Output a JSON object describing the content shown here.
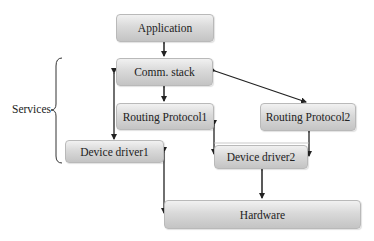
{
  "diagram": {
    "nodes": [
      {
        "id": "application",
        "label": "Application"
      },
      {
        "id": "comm_stack",
        "label": "Comm. stack"
      },
      {
        "id": "routing_protocol1",
        "label": "Routing Protocol1"
      },
      {
        "id": "routing_protocol2",
        "label": "Routing Protocol2"
      },
      {
        "id": "device_driver1",
        "label": "Device driver1"
      },
      {
        "id": "device_driver2",
        "label": "Device driver2"
      },
      {
        "id": "hardware",
        "label": "Hardware"
      }
    ],
    "group": {
      "label": "Services",
      "members": [
        "comm_stack",
        "routing_protocol1",
        "device_driver1"
      ]
    },
    "edges": [
      {
        "from": "application",
        "to": "comm_stack",
        "bidirectional": true
      },
      {
        "from": "comm_stack",
        "to": "routing_protocol1",
        "bidirectional": true
      },
      {
        "from": "comm_stack",
        "to": "routing_protocol2",
        "bidirectional": true
      },
      {
        "from": "comm_stack",
        "to": "device_driver1",
        "bidirectional": true
      },
      {
        "from": "routing_protocol1",
        "to": "device_driver2",
        "bidirectional": true
      },
      {
        "from": "routing_protocol2",
        "to": "device_driver2",
        "bidirectional": true
      },
      {
        "from": "device_driver1",
        "to": "hardware",
        "bidirectional": true
      },
      {
        "from": "device_driver2",
        "to": "hardware",
        "bidirectional": true
      }
    ]
  }
}
